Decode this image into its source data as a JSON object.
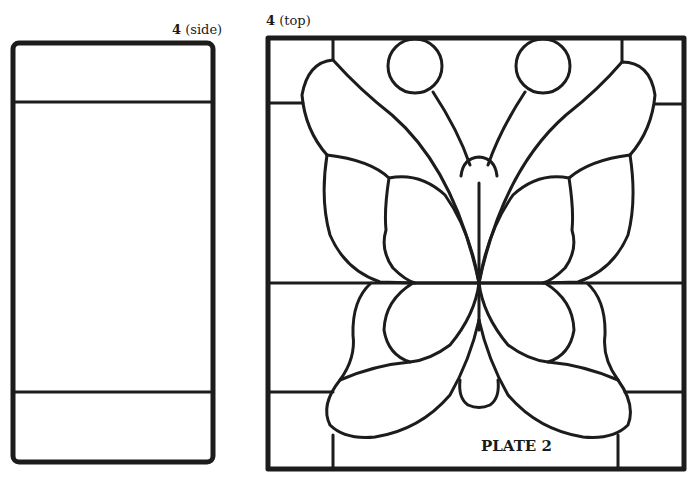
{
  "figure": {
    "side_panel": {
      "number": "4",
      "view": "(side)",
      "sections": [
        "top-strip",
        "main-pane",
        "bottom-strip"
      ]
    },
    "top_panel": {
      "number": "4",
      "view": "(top)",
      "subject": "butterfly stained-glass pattern"
    },
    "plate_label": "PLATE 2"
  },
  "colors": {
    "lead_line": "#1c1c1c",
    "background": "#ffffff"
  }
}
